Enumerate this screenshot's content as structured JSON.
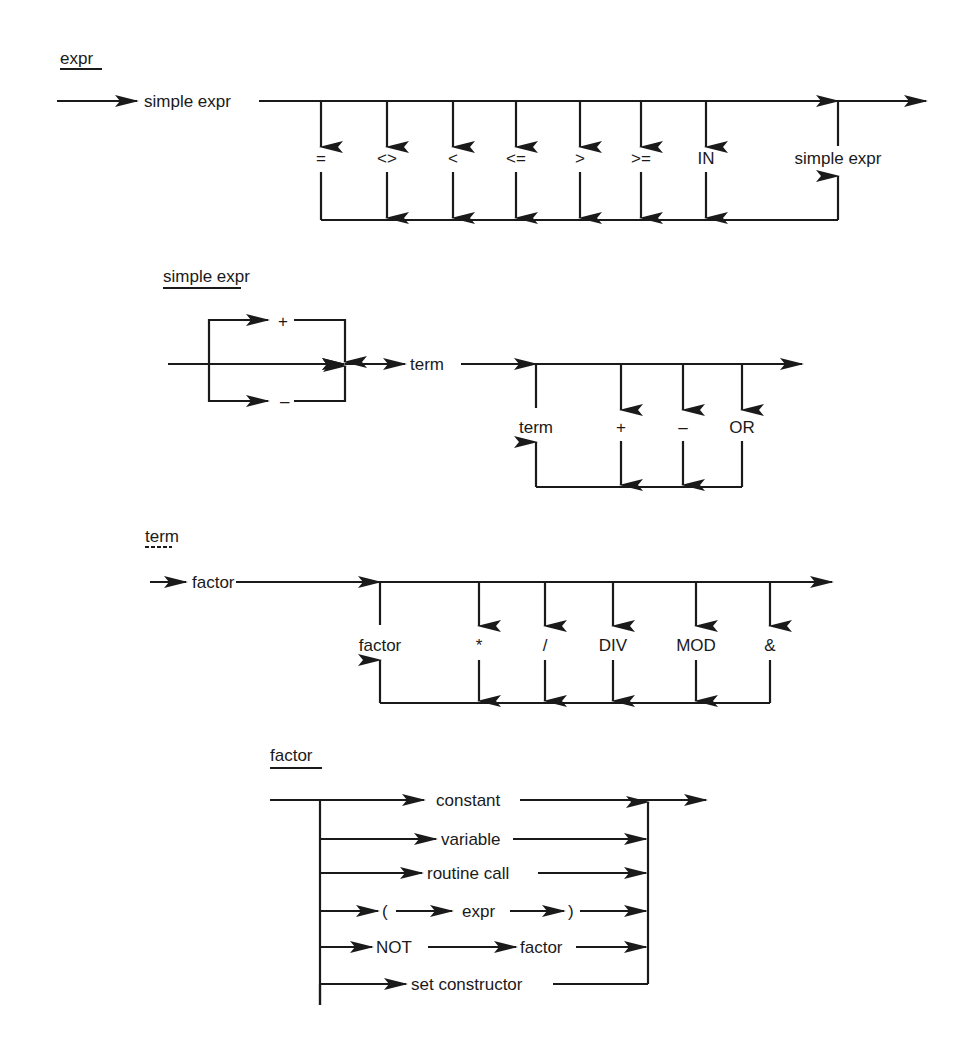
{
  "diagrams": {
    "expr": {
      "title": "expr",
      "entry": "simple expr",
      "operators": [
        "=",
        "<>",
        "<",
        "<=",
        ">",
        ">=",
        "IN"
      ],
      "return": "simple expr"
    },
    "simple_expr": {
      "title": "simple expr",
      "sign_options": [
        "+",
        "–"
      ],
      "main": "term",
      "loop_back": "term",
      "operators": [
        "+",
        "–",
        "OR"
      ]
    },
    "term": {
      "title": "term",
      "entry": "factor",
      "loop_back": "factor",
      "operators": [
        "*",
        "/",
        "DIV",
        "MOD",
        "&"
      ]
    },
    "factor": {
      "title": "factor",
      "alternatives": [
        "constant",
        "variable",
        "routine call",
        "NOT",
        "set constructor"
      ],
      "paren_open": "(",
      "paren_expr": "expr",
      "paren_close": ")",
      "not_operand": "factor"
    }
  },
  "colors": {
    "ink": "#1a1a1a",
    "paper": "#ffffff"
  }
}
